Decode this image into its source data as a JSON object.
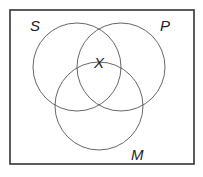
{
  "diagram": {
    "type": "venn",
    "frame_color": "#333333",
    "circle_color": "#555555",
    "sets": [
      {
        "label": "S",
        "cx": 77,
        "cy": 67,
        "r": 44
      },
      {
        "label": "P",
        "cx": 121,
        "cy": 67,
        "r": 44
      },
      {
        "label": "M",
        "cx": 99,
        "cy": 106,
        "r": 44
      }
    ],
    "labels": {
      "S": "S",
      "P": "P",
      "M": "M",
      "X": "X"
    }
  }
}
